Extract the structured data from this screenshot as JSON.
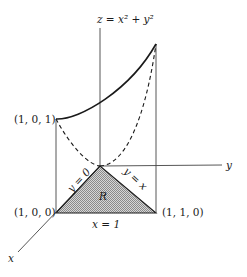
{
  "figure": {
    "surface_label": "z = x² + y²",
    "axis_labels": {
      "x": "x",
      "y": "y"
    },
    "points": {
      "p101": "(1, 0, 1)",
      "p100": "(1, 0, 0)",
      "p110": "(1, 1, 0)"
    },
    "region_label": "R",
    "edge_labels": {
      "y0": "y = 0",
      "yx": "y = x",
      "x1": "x = 1"
    },
    "colors": {
      "ink": "#1a1a1a",
      "region_fill": "#bdbdbd"
    }
  }
}
